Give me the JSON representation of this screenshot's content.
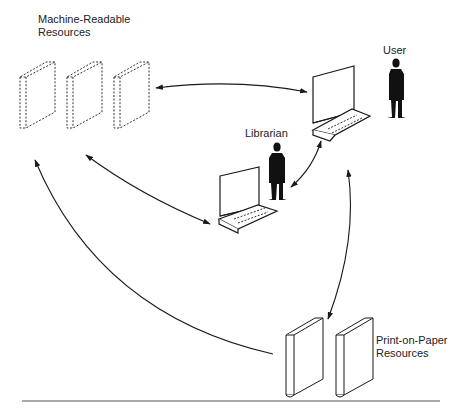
{
  "diagram": {
    "labels": {
      "machine_readable": [
        "Machine-Readable",
        "Resources"
      ],
      "user": "User",
      "librarian": "Librarian",
      "print_on_paper": [
        "Print-on-Paper",
        "Resources"
      ]
    },
    "nodes": [
      {
        "id": "machine-readable-resources",
        "kind": "dashed-books",
        "count": 3
      },
      {
        "id": "user-terminal",
        "kind": "computer-terminal"
      },
      {
        "id": "user",
        "kind": "person"
      },
      {
        "id": "librarian-terminal",
        "kind": "computer-terminal"
      },
      {
        "id": "librarian",
        "kind": "person"
      },
      {
        "id": "print-on-paper-resources",
        "kind": "solid-books",
        "count": 2
      }
    ],
    "edges": [
      {
        "from": "machine-readable-resources",
        "to": "user-terminal",
        "direction": "both"
      },
      {
        "from": "machine-readable-resources",
        "to": "librarian-terminal",
        "direction": "both"
      },
      {
        "from": "librarian",
        "to": "user-terminal",
        "direction": "both"
      },
      {
        "from": "print-on-paper-resources",
        "to": "user-terminal",
        "direction": "both"
      },
      {
        "from": "print-on-paper-resources",
        "to": "machine-readable-resources",
        "direction": "one-way"
      }
    ],
    "colors": {
      "ink": "#1a1a1a",
      "rule": "#555555",
      "background": "#ffffff"
    }
  }
}
